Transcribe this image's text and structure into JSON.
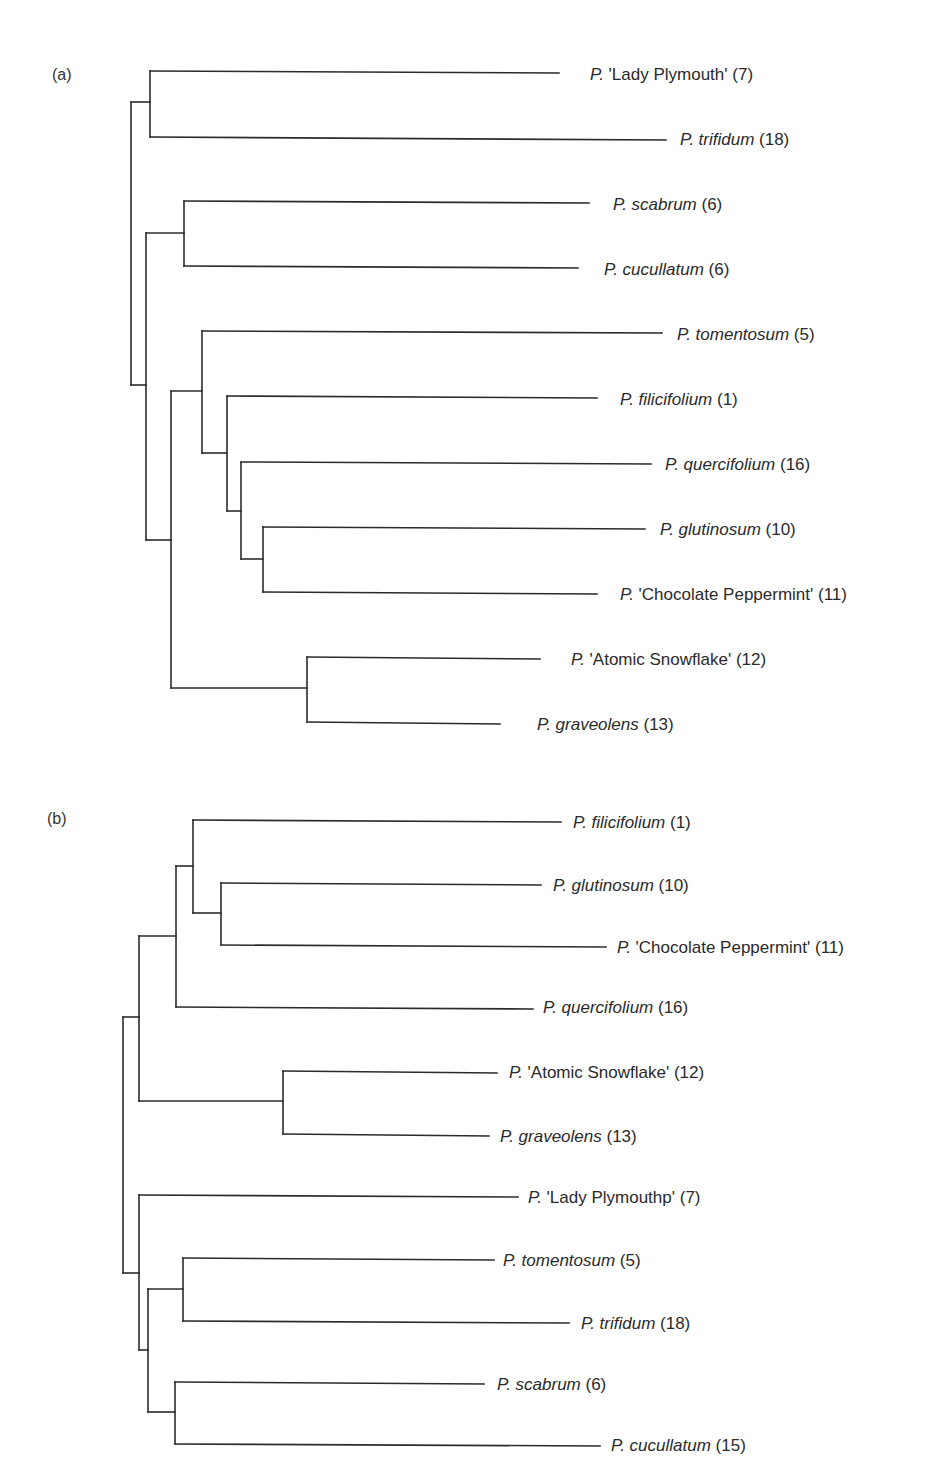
{
  "figure": {
    "panels": [
      {
        "label": "(a)",
        "label_pos": [
          52,
          78
        ],
        "leaves": [
          {
            "genus": "P.",
            "name": "'Lady Plymouth'",
            "italic_name": false,
            "count": "(7)",
            "y": 75,
            "x_end": 559,
            "label_x": 590
          },
          {
            "genus": "P.",
            "name": "trifidum",
            "italic_name": true,
            "count": "(18)",
            "y": 140,
            "x_end": 666,
            "label_x": 680
          },
          {
            "genus": "P.",
            "name": "scabrum",
            "italic_name": true,
            "count": "(6)",
            "y": 205,
            "x_end": 589,
            "label_x": 613
          },
          {
            "genus": "P.",
            "name": "cucullatum",
            "italic_name": true,
            "count": "(6)",
            "y": 270,
            "x_end": 578,
            "label_x": 604
          },
          {
            "genus": "P.",
            "name": "tomentosum",
            "italic_name": true,
            "count": "(5)",
            "y": 335,
            "x_end": 662,
            "label_x": 677
          },
          {
            "genus": "P.",
            "name": "filicifolium",
            "italic_name": true,
            "count": "(1)",
            "y": 400,
            "x_end": 597,
            "label_x": 620
          },
          {
            "genus": "P.",
            "name": "quercifolium",
            "italic_name": true,
            "count": "(16)",
            "y": 465,
            "x_end": 651,
            "label_x": 665
          },
          {
            "genus": "P.",
            "name": "glutinosum",
            "italic_name": true,
            "count": "(10)",
            "y": 530,
            "x_end": 645,
            "label_x": 660
          },
          {
            "genus": "P.",
            "name": "'Chocolate Peppermint'",
            "italic_name": false,
            "count": "(11)",
            "y": 595,
            "x_end": 597,
            "label_x": 620
          },
          {
            "genus": "P.",
            "name": "'Atomic Snowflake'",
            "italic_name": false,
            "count": "(12)",
            "y": 660,
            "x_end": 540,
            "label_x": 571
          },
          {
            "genus": "P.",
            "name": "graveolens",
            "italic_name": true,
            "count": "(13)",
            "y": 725,
            "x_end": 500,
            "label_x": 537
          }
        ],
        "edges": [
          [
            150,
            71,
            559,
            73
          ],
          [
            150,
            137,
            666,
            140
          ],
          [
            150,
            71,
            150,
            137
          ],
          [
            131,
            102,
            150,
            102
          ],
          [
            131,
            102,
            131,
            385
          ],
          [
            131,
            385,
            146,
            385
          ],
          [
            184,
            201,
            589,
            203
          ],
          [
            184,
            266,
            578,
            268
          ],
          [
            184,
            201,
            184,
            266
          ],
          [
            146,
            233,
            184,
            233
          ],
          [
            146,
            233,
            146,
            540
          ],
          [
            146,
            540,
            171,
            540
          ],
          [
            202,
            331,
            662,
            333
          ],
          [
            202,
            331,
            202,
            453
          ],
          [
            171,
            391,
            202,
            391
          ],
          [
            171,
            391,
            171,
            688
          ],
          [
            227,
            396,
            597,
            398
          ],
          [
            227,
            396,
            227,
            511
          ],
          [
            202,
            453,
            227,
            453
          ],
          [
            241,
            462,
            651,
            464
          ],
          [
            241,
            462,
            241,
            559
          ],
          [
            227,
            511,
            241,
            511
          ],
          [
            263,
            527,
            645,
            529
          ],
          [
            263,
            592,
            597,
            594
          ],
          [
            263,
            527,
            263,
            592
          ],
          [
            241,
            559,
            263,
            559
          ],
          [
            307,
            657,
            540,
            659
          ],
          [
            307,
            722,
            500,
            724
          ],
          [
            307,
            657,
            307,
            722
          ],
          [
            171,
            688,
            307,
            688
          ]
        ]
      },
      {
        "label": "(b)",
        "label_pos": [
          47,
          822
        ],
        "leaves": [
          {
            "genus": "P.",
            "name": "filicifolium",
            "italic_name": true,
            "count": "(1)",
            "y": 823,
            "x_end": 561,
            "label_x": 573
          },
          {
            "genus": "P.",
            "name": "glutinosum",
            "italic_name": true,
            "count": "(10)",
            "y": 886,
            "x_end": 541,
            "label_x": 553
          },
          {
            "genus": "P.",
            "name": "'Chocolate Peppermint'",
            "italic_name": false,
            "count": "(11)",
            "y": 948,
            "x_end": 606,
            "label_x": 617
          },
          {
            "genus": "P.",
            "name": "quercifolium",
            "italic_name": true,
            "count": "(16)",
            "y": 1008,
            "x_end": 533,
            "label_x": 543
          },
          {
            "genus": "P.",
            "name": "'Atomic Snowflake'",
            "italic_name": false,
            "count": "(12)",
            "y": 1073,
            "x_end": 497,
            "label_x": 509
          },
          {
            "genus": "P.",
            "name": "graveolens",
            "italic_name": true,
            "count": "(13)",
            "y": 1137,
            "x_end": 489,
            "label_x": 500
          },
          {
            "genus": "P.",
            "name": "'Lady Plymouthp'",
            "italic_name": false,
            "count": "(7)",
            "y": 1198,
            "x_end": 518,
            "label_x": 528
          },
          {
            "genus": "P.",
            "name": "tomentosum",
            "italic_name": true,
            "count": "(5)",
            "y": 1261,
            "x_end": 494,
            "label_x": 503
          },
          {
            "genus": "P.",
            "name": "trifidum",
            "italic_name": true,
            "count": "(18)",
            "y": 1324,
            "x_end": 569,
            "label_x": 581
          },
          {
            "genus": "P.",
            "name": "scabrum",
            "italic_name": true,
            "count": "(6)",
            "y": 1385,
            "x_end": 484,
            "label_x": 497
          },
          {
            "genus": "P.",
            "name": "cucullatum",
            "italic_name": true,
            "count": "(15)",
            "y": 1446,
            "x_end": 600,
            "label_x": 611
          }
        ],
        "edges": [
          [
            193,
            820,
            561,
            822
          ],
          [
            193,
            820,
            193,
            913
          ],
          [
            176,
            866,
            193,
            866
          ],
          [
            176,
            866,
            176,
            1007
          ],
          [
            221,
            883,
            541,
            885
          ],
          [
            221,
            945,
            606,
            947
          ],
          [
            221,
            883,
            221,
            945
          ],
          [
            193,
            913,
            221,
            913
          ],
          [
            176,
            1007,
            533,
            1009
          ],
          [
            139,
            936,
            176,
            936
          ],
          [
            139,
            936,
            139,
            1101
          ],
          [
            123,
            1017,
            139,
            1017
          ],
          [
            123,
            1017,
            123,
            1273
          ],
          [
            283,
            1071,
            497,
            1073
          ],
          [
            283,
            1134,
            489,
            1136
          ],
          [
            283,
            1071,
            283,
            1134
          ],
          [
            139,
            1101,
            283,
            1101
          ],
          [
            139,
            1195,
            518,
            1197
          ],
          [
            139,
            1195,
            139,
            1350
          ],
          [
            123,
            1273,
            139,
            1273
          ],
          [
            183,
            1258,
            494,
            1260
          ],
          [
            183,
            1321,
            569,
            1323
          ],
          [
            183,
            1258,
            183,
            1321
          ],
          [
            148,
            1289,
            183,
            1289
          ],
          [
            148,
            1289,
            148,
            1412
          ],
          [
            139,
            1350,
            148,
            1350
          ],
          [
            175,
            1382,
            484,
            1384
          ],
          [
            175,
            1444,
            600,
            1446
          ],
          [
            175,
            1382,
            175,
            1444
          ],
          [
            148,
            1412,
            175,
            1412
          ]
        ]
      }
    ]
  },
  "colors": {
    "line": "#2b2b2b",
    "text": "#2a2a2a",
    "background": "#ffffff"
  }
}
